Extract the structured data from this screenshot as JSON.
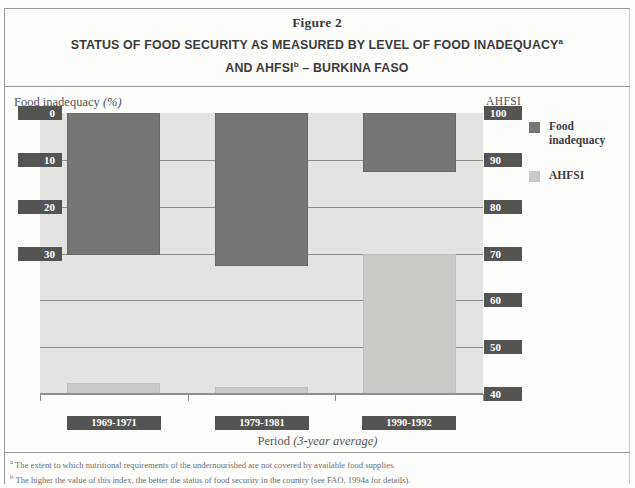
{
  "figure": {
    "number_label": "Figure 2",
    "title_line1": "STATUS OF FOOD SECURITY AS MEASURED BY LEVEL OF FOOD INADEQUACY",
    "title_line1_sup": "a",
    "title_line2_pre": "AND AHFSI",
    "title_line2_sup": "b",
    "title_line2_post": " – BURKINA FASO"
  },
  "axes": {
    "left_title_main": "Food inadequacy ",
    "left_title_unit": "(%)",
    "right_title": "AHFSI",
    "x_title_main": "Period ",
    "x_title_em": "(3-year average)"
  },
  "legend": {
    "items": [
      {
        "label": "Food inadequacy",
        "color": "#767674"
      },
      {
        "label": "AHFSI",
        "color": "#c9cac6"
      }
    ]
  },
  "footnotes": [
    {
      "marker": "a",
      "text": "The extent to which nutritional requirements of the undernourished are not covered by available food supplies."
    },
    {
      "marker": "b",
      "text": "The higher the value of this index, the better the status of food security in the country (see FAO, 1994a for details)."
    }
  ],
  "chart_data": {
    "type": "bar",
    "subtitle": "Figure 2",
    "xlabel": "Period (3-year average)",
    "categories": [
      "1969-1971",
      "1979-1981",
      "1990-1992"
    ],
    "grid": true,
    "legend_position": "right",
    "series": [
      {
        "name": "Food inadequacy",
        "axis": "left",
        "unit": "%",
        "color": "#767674",
        "orientation": "hanging-from-top",
        "values": [
          30.3,
          32.6,
          12.6
        ]
      },
      {
        "name": "AHFSI",
        "axis": "right",
        "unit": "index",
        "color": "#c9cac6",
        "orientation": "rising-from-bottom",
        "values": [
          42.3,
          41.5,
          70.0
        ]
      }
    ],
    "left_axis": {
      "label": "Food inadequacy (%)",
      "ticks": [
        "0",
        "10",
        "20",
        "30"
      ],
      "tick_values": [
        0,
        10,
        20,
        30
      ],
      "inverted": true,
      "ylim": [
        0,
        60
      ]
    },
    "right_axis": {
      "label": "AHFSI",
      "ticks": [
        "100",
        "90",
        "80",
        "70",
        "60",
        "50",
        "40"
      ],
      "tick_values": [
        100,
        90,
        80,
        70,
        60,
        50,
        40
      ],
      "ylim": [
        40,
        100
      ]
    }
  }
}
